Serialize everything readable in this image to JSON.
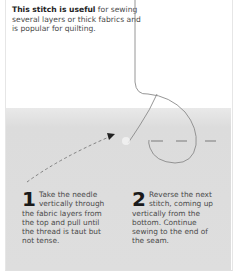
{
  "intro": {
    "bold": "This stitch is useful",
    "rest": " for sewing several layers or thick fabrics and is popular for quilting."
  },
  "steps": [
    {
      "number": "1",
      "text": "Take the needle vertically through the fabric layers from the top and pull until the thread is taut but not tense."
    },
    {
      "number": "2",
      "text": "Reverse the next stitch, coming up vertically from the bottom. Continue sewing to the end of the seam."
    }
  ],
  "illustration": {
    "icons": [
      "thread-icon",
      "needle-entry-arrow-icon",
      "stitch-dashes-icon"
    ],
    "colors": {
      "page": "#ffffff",
      "fabric": "#dedede",
      "thread": "#8a8a8a",
      "text": "#4a4a4a",
      "heading": "#1a1a1a"
    }
  }
}
